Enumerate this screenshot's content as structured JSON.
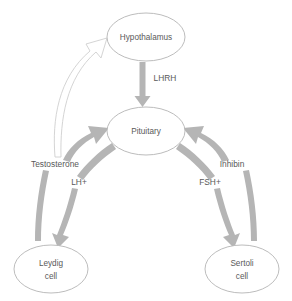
{
  "diagram": {
    "background_color": "#ffffff",
    "node_stroke_color": "#b4b4b4",
    "arrow_color": "#b5b5b5",
    "text_color": "#595959",
    "nodes": [
      {
        "id": "hypothalamus",
        "label": "Hypothalamus",
        "cx": 146,
        "cy": 37,
        "rx": 39,
        "ry": 24
      },
      {
        "id": "pituitary",
        "label": "Pituitary",
        "cx": 146,
        "cy": 131,
        "rx": 39,
        "ry": 24
      },
      {
        "id": "leydig",
        "label_line1": "Leydig",
        "label_line2": "cell",
        "cx": 51,
        "cy": 269,
        "rx": 37,
        "ry": 24
      },
      {
        "id": "sertoli",
        "label_line1": "Sertoli",
        "label_line2": "cell",
        "cx": 242,
        "cy": 269,
        "rx": 37,
        "ry": 24
      }
    ],
    "edge_labels": [
      {
        "id": "lhrh",
        "text": "LHRH",
        "x": 165,
        "y": 79
      },
      {
        "id": "testosterone",
        "text": "Testosterone",
        "x": 55,
        "y": 165
      },
      {
        "id": "lh-plus",
        "text": "LH+",
        "x": 79,
        "y": 183
      },
      {
        "id": "inhibin",
        "text": "Inhibin",
        "x": 232,
        "y": 165
      },
      {
        "id": "fsh-plus",
        "text": "FSH+",
        "x": 210,
        "y": 183
      }
    ],
    "edges": [
      {
        "id": "hypothalamus-to-pituitary",
        "from": "hypothalamus",
        "to": "pituitary",
        "label": "LHRH",
        "style": "solid-thick-gray",
        "direction": "down"
      },
      {
        "id": "pituitary-to-leydig",
        "from": "pituitary",
        "to": "leydig",
        "label": "LH+",
        "style": "solid-thick-gray",
        "direction": "down-left"
      },
      {
        "id": "pituitary-to-sertoli",
        "from": "pituitary",
        "to": "sertoli",
        "label": "FSH+",
        "style": "solid-thick-gray",
        "direction": "down-right"
      },
      {
        "id": "leydig-to-pituitary",
        "from": "leydig",
        "to": "pituitary",
        "label": "Testosterone",
        "style": "solid-thick-gray",
        "direction": "up-right"
      },
      {
        "id": "sertoli-to-pituitary",
        "from": "sertoli",
        "to": "pituitary",
        "label": "Inhibin",
        "style": "solid-thick-gray",
        "direction": "up-left"
      },
      {
        "id": "testosterone-to-hypothalamus",
        "from": "leydig",
        "to": "hypothalamus",
        "label": "Testosterone",
        "style": "hollow-outline",
        "direction": "up-right"
      }
    ]
  }
}
